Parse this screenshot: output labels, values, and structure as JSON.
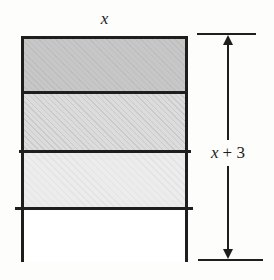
{
  "figure": {
    "labels": {
      "width": "x",
      "height_variable": "x",
      "height_rest": "+ 3"
    },
    "colors": {
      "background": "#fdfdfc",
      "line": "#1e1e1e",
      "strip1": "#c7c7c7",
      "strip2": "#dcdcdc",
      "strip3": "#ececec",
      "strip4": "#ffffff"
    }
  }
}
